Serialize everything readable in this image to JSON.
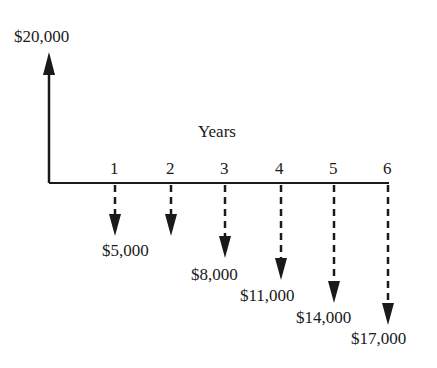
{
  "diagram": {
    "type": "cash-flow",
    "axis_label": "Years",
    "inflow": {
      "year": 0,
      "amount": 20000,
      "label": "$20,000"
    },
    "periods": [
      "1",
      "2",
      "3",
      "4",
      "5",
      "6"
    ],
    "outflows": [
      {
        "year": 1,
        "amount": 5000,
        "label": "$5,000"
      },
      {
        "year": 2,
        "amount": 5000,
        "label": ""
      },
      {
        "year": 3,
        "amount": 8000,
        "label": "$8,000"
      },
      {
        "year": 4,
        "amount": 11000,
        "label": "$11,000"
      },
      {
        "year": 5,
        "amount": 14000,
        "label": "$14,000"
      },
      {
        "year": 6,
        "amount": 17000,
        "label": "$17,000"
      }
    ],
    "colors": {
      "line": "#1a1a1a",
      "background": "#ffffff"
    }
  }
}
